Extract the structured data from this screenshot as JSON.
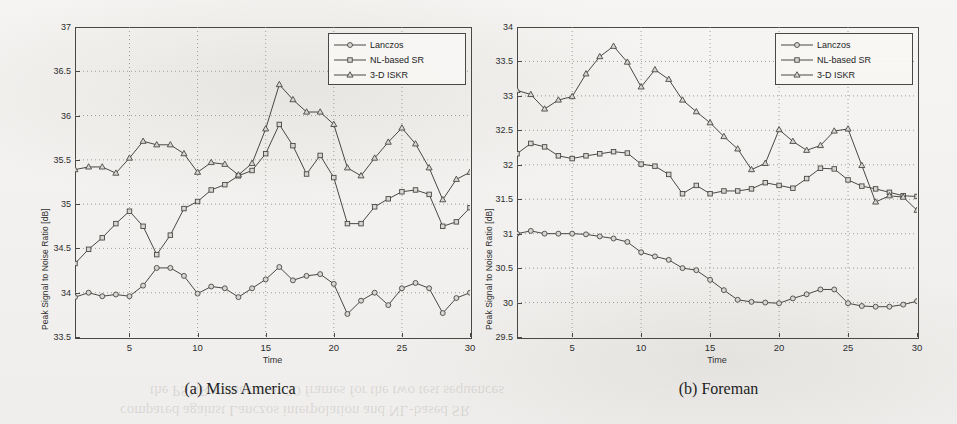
{
  "figure": {
    "background_color": "#f2f1ef",
    "ink_color": "#4a4845",
    "marker_fill": "#d8d6d2"
  },
  "panels": [
    {
      "id": "a",
      "caption": "(a) Miss America",
      "xlabel": "Time",
      "ylabel": "Peak Signal to Noise Ratio [dB]",
      "yticks": [
        "33.5",
        "34",
        "34.5",
        "35",
        "35.5",
        "36",
        "36.5",
        "37"
      ],
      "xticks": [
        "5",
        "10",
        "15",
        "20",
        "25",
        "30"
      ],
      "legend": [
        "Lanczos",
        "NL-based SR",
        "3-D ISKR"
      ]
    },
    {
      "id": "b",
      "caption": "(b) Foreman",
      "xlabel": "Time",
      "ylabel": "Peak Signal to Noise Ratio [dB]",
      "yticks": [
        "29.5",
        "30",
        "30.5",
        "31",
        "31.5",
        "32",
        "32.5",
        "33",
        "33.5",
        "34"
      ],
      "xticks": [
        "5",
        "10",
        "15",
        "20",
        "25",
        "30"
      ],
      "legend": [
        "Lanczos",
        "NL-based SR",
        "3-D ISKR"
      ]
    }
  ],
  "ghost_text": {
    "line1": "the PSNR values over 30 frames for the two test sequences",
    "line2": "compared against Lanczos interpolation and NL-based SR"
  },
  "chart_data": [
    {
      "type": "line",
      "title": "(a) Miss America",
      "xlabel": "Time",
      "ylabel": "Peak Signal to Noise Ratio [dB]",
      "xlim": [
        1,
        30
      ],
      "ylim": [
        33.5,
        37
      ],
      "xticks": [
        5,
        10,
        15,
        20,
        25,
        30
      ],
      "yticks": [
        33.5,
        34,
        34.5,
        35,
        35.5,
        36,
        36.5,
        37
      ],
      "grid": true,
      "legend_position": "top-right",
      "x": [
        1,
        2,
        3,
        4,
        5,
        6,
        7,
        8,
        9,
        10,
        11,
        12,
        13,
        14,
        15,
        16,
        17,
        18,
        19,
        20,
        21,
        22,
        23,
        24,
        25,
        26,
        27,
        28,
        29,
        30
      ],
      "series": [
        {
          "name": "Lanczos",
          "marker": "circle",
          "values": [
            33.95,
            34.0,
            33.96,
            33.98,
            33.96,
            34.08,
            34.28,
            34.28,
            34.19,
            33.99,
            34.07,
            34.05,
            33.95,
            34.05,
            34.15,
            34.29,
            34.14,
            34.19,
            34.21,
            34.1,
            33.76,
            33.91,
            34.0,
            33.86,
            34.05,
            34.11,
            34.05,
            33.77,
            33.94,
            34.0
          ]
        },
        {
          "name": "NL-based SR",
          "marker": "square",
          "values": [
            34.33,
            34.49,
            34.62,
            34.78,
            34.92,
            34.75,
            34.43,
            34.65,
            34.95,
            35.03,
            35.16,
            35.22,
            35.32,
            35.38,
            35.57,
            35.9,
            35.66,
            35.34,
            35.55,
            35.3,
            34.78,
            34.78,
            34.97,
            35.06,
            35.14,
            35.16,
            35.11,
            34.75,
            34.8,
            34.96
          ]
        },
        {
          "name": "3-D ISKR",
          "marker": "triangle",
          "values": [
            35.39,
            35.42,
            35.42,
            35.35,
            35.52,
            35.71,
            35.67,
            35.67,
            35.57,
            35.36,
            35.47,
            35.45,
            35.33,
            35.46,
            35.85,
            36.35,
            36.18,
            36.04,
            36.04,
            35.9,
            35.41,
            35.32,
            35.52,
            35.7,
            35.86,
            35.68,
            35.41,
            35.05,
            35.28,
            35.36
          ]
        }
      ]
    },
    {
      "type": "line",
      "title": "(b) Foreman",
      "xlabel": "Time",
      "ylabel": "Peak Signal to Noise Ratio [dB]",
      "xlim": [
        1,
        30
      ],
      "ylim": [
        29.5,
        34
      ],
      "xticks": [
        5,
        10,
        15,
        20,
        25,
        30
      ],
      "yticks": [
        29.5,
        30,
        30.5,
        31,
        31.5,
        32,
        32.5,
        33,
        33.5,
        34
      ],
      "grid": true,
      "legend_position": "top-right",
      "x": [
        1,
        2,
        3,
        4,
        5,
        6,
        7,
        8,
        9,
        10,
        11,
        12,
        13,
        14,
        15,
        16,
        17,
        18,
        19,
        20,
        21,
        22,
        23,
        24,
        25,
        26,
        27,
        28,
        29,
        30
      ],
      "series": [
        {
          "name": "Lanczos",
          "marker": "circle",
          "values": [
            31.0,
            31.04,
            31.0,
            31.0,
            31.0,
            30.99,
            30.96,
            30.93,
            30.88,
            30.73,
            30.67,
            30.62,
            30.5,
            30.47,
            30.33,
            30.18,
            30.04,
            30.01,
            30.0,
            29.99,
            30.06,
            30.12,
            30.19,
            30.19,
            29.99,
            29.95,
            29.94,
            29.94,
            29.97,
            30.02
          ]
        },
        {
          "name": "NL-based SR",
          "marker": "square",
          "values": [
            32.16,
            32.31,
            32.26,
            32.13,
            32.09,
            32.13,
            32.16,
            32.19,
            32.17,
            32.01,
            31.98,
            31.86,
            31.58,
            31.7,
            31.58,
            31.62,
            31.62,
            31.65,
            31.74,
            31.7,
            31.66,
            31.8,
            31.95,
            31.94,
            31.78,
            31.69,
            31.65,
            31.6,
            31.55,
            31.54
          ]
        },
        {
          "name": "3-D ISKR",
          "marker": "triangle",
          "values": [
            33.08,
            33.02,
            32.81,
            32.94,
            32.99,
            33.32,
            33.57,
            33.72,
            33.49,
            33.13,
            33.38,
            33.24,
            32.94,
            32.77,
            32.61,
            32.41,
            32.23,
            31.93,
            32.02,
            32.51,
            32.34,
            32.21,
            32.28,
            32.49,
            32.52,
            31.99,
            31.46,
            31.55,
            31.53,
            31.34
          ]
        }
      ]
    }
  ]
}
